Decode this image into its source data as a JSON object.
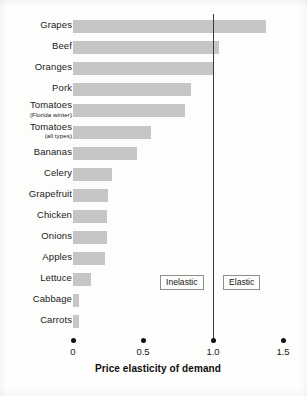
{
  "chart_data": {
    "type": "bar",
    "orientation": "horizontal",
    "title": "",
    "xlabel": "Price elasticity of demand",
    "ylabel": "",
    "xlim": [
      0,
      1.5
    ],
    "xticks": [
      "0",
      "0.5",
      "1.0",
      "1.5"
    ],
    "xtick_values": [
      0,
      0.5,
      1.0,
      1.5
    ],
    "grid": false,
    "legend": "none",
    "bar_color": "#c6c6c6",
    "reference_line": {
      "value": 1.0,
      "color": "#3b3b3b",
      "label": "unit elasticity"
    },
    "annotations": [
      {
        "text": "Inelastic",
        "region": "left-of-unity"
      },
      {
        "text": "Elastic",
        "region": "right-of-unity"
      }
    ],
    "categories": [
      "Grapes",
      "Beef",
      "Oranges",
      "Pork",
      "Tomatoes",
      "Tomatoes",
      "Bananas",
      "Celery",
      "Grapefruit",
      "Chicken",
      "Onions",
      "Apples",
      "Lettuce",
      "Cabbage",
      "Carrots"
    ],
    "values": [
      1.38,
      1.04,
      1.0,
      0.84,
      0.8,
      0.56,
      0.46,
      0.28,
      0.25,
      0.24,
      0.24,
      0.23,
      0.13,
      0.04,
      0.04
    ],
    "items": [
      {
        "label": "Grapes",
        "sublabel": "",
        "value": 1.38
      },
      {
        "label": "Beef",
        "sublabel": "",
        "value": 1.04
      },
      {
        "label": "Oranges",
        "sublabel": "",
        "value": 1.0
      },
      {
        "label": "Pork",
        "sublabel": "",
        "value": 0.84
      },
      {
        "label": "Tomatoes",
        "sublabel": "(Florida winter)",
        "value": 0.8
      },
      {
        "label": "Tomatoes",
        "sublabel": "(all types)",
        "value": 0.56
      },
      {
        "label": "Bananas",
        "sublabel": "",
        "value": 0.46
      },
      {
        "label": "Celery",
        "sublabel": "",
        "value": 0.28
      },
      {
        "label": "Grapefruit",
        "sublabel": "",
        "value": 0.25
      },
      {
        "label": "Chicken",
        "sublabel": "",
        "value": 0.24
      },
      {
        "label": "Onions",
        "sublabel": "",
        "value": 0.24
      },
      {
        "label": "Apples",
        "sublabel": "",
        "value": 0.23
      },
      {
        "label": "Lettuce",
        "sublabel": "",
        "value": 0.13
      },
      {
        "label": "Cabbage",
        "sublabel": "",
        "value": 0.04
      },
      {
        "label": "Carrots",
        "sublabel": "",
        "value": 0.04
      }
    ]
  }
}
